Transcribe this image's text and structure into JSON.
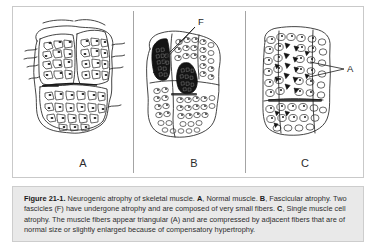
{
  "figure": {
    "number": "Figure 21-1",
    "panels": [
      {
        "id": "A",
        "letter": "A",
        "title": "Normal muscle",
        "description": "Cross-section of skeletal muscle showing fascicles of uniformly sized polygonal fibers with peripheral nuclei."
      },
      {
        "id": "B",
        "letter": "B",
        "title": "Fascicular atrophy",
        "description": "Two fascicles have undergone atrophy and are composed of very small, densely packed dark fibers.",
        "marker": "F",
        "marker_meaning": "fascicle"
      },
      {
        "id": "C",
        "letter": "C",
        "title": "Single muscle cell atrophy",
        "description": "Scattered dark angular atrophic fibers compressed between normal or hypertrophied fibers.",
        "marker": "A",
        "marker_meaning": "angular atrophic fiber"
      }
    ],
    "caption": {
      "label": "Figure 21-1",
      "label_suffix": ".",
      "segments": [
        {
          "bold": false,
          "text": " Neurogenic atrophy of skeletal muscle. "
        },
        {
          "bold": true,
          "text": "A"
        },
        {
          "bold": false,
          "text": ", Normal muscle. "
        },
        {
          "bold": true,
          "text": "B"
        },
        {
          "bold": false,
          "text": ", Fascicular atrophy. Two fascicles (F) have undergone atrophy and are composed of very small fibers. "
        },
        {
          "bold": true,
          "text": "C"
        },
        {
          "bold": false,
          "text": ", Single muscle cell atrophy. The muscle fibers appear triangular (A) and are compressed by adjacent fibers that are of normal size or slightly enlarged because of compensatory hypertrophy."
        }
      ],
      "full_text": "Figure 21-1. Neurogenic atrophy of skeletal muscle. A, Normal muscle. B, Fascicular atrophy. Two fascicles (F) have undergone atrophy and are composed of very small fibers. C, Single muscle cell atrophy. The muscle fibers appear triangular (A) and are compressed by adjacent fibers that are of normal size or slightly enlarged because of compensatory hypertrophy."
    }
  },
  "colors": {
    "page_background": "#ffffff",
    "plate_border": "#c9c9c9",
    "caption_background": "#e9e9e9",
    "caption_border": "#cdcdcd",
    "caption_text": "#2e2e2e",
    "ink": "#1d1d1d",
    "atrophic_fill": "#141414"
  }
}
